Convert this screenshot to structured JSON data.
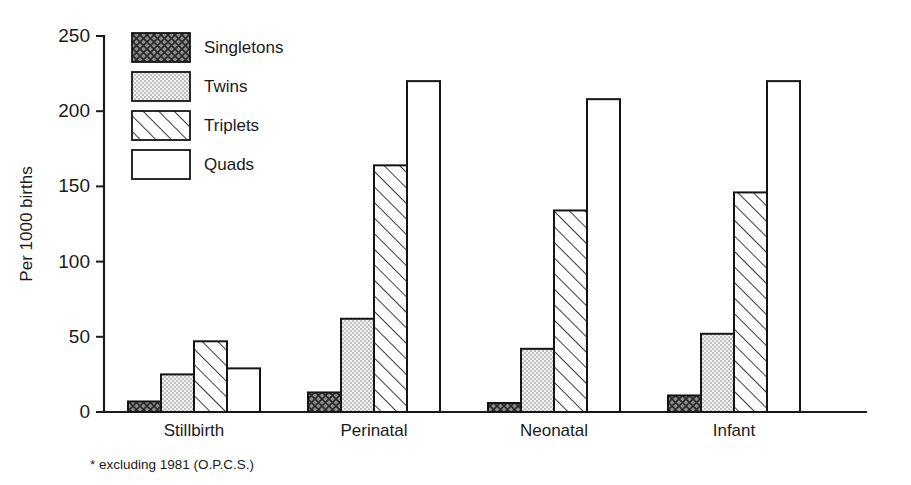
{
  "chart_data": {
    "type": "bar",
    "title": "",
    "subtitle": "",
    "xlabel": "",
    "ylabel": "Per 1000 births",
    "categories": [
      "Stillbirth",
      "Perinatal",
      "Neonatal",
      "Infant"
    ],
    "series": [
      {
        "name": "Singletons",
        "pattern": "cross-hatch-dark",
        "values": [
          7,
          13,
          6,
          11
        ]
      },
      {
        "name": "Twins",
        "pattern": "fine-stipple-light",
        "values": [
          25,
          62,
          42,
          52
        ]
      },
      {
        "name": "Triplets",
        "pattern": "diagonal-hatch",
        "values": [
          47,
          164,
          134,
          146
        ]
      },
      {
        "name": "Quads",
        "pattern": "solid-white",
        "values": [
          29,
          220,
          208,
          220
        ]
      }
    ],
    "ylim": [
      0,
      250
    ],
    "yticks": [
      0,
      50,
      100,
      150,
      200,
      250
    ],
    "ytick_labels": [
      "0",
      "50",
      "100",
      "150",
      "200",
      "250"
    ],
    "grid": false,
    "legend_position": "top-left-inside",
    "legend_entries": [
      "Singletons",
      "Twins",
      "Triplets",
      "Quads"
    ],
    "annotations": [
      "* excluding 1981 (O.P.C.S.)"
    ]
  },
  "footnote": "* excluding 1981 (O.P.C.S.)",
  "colors": {
    "background": "#ffffff",
    "ink": "#1a1a1a",
    "axis": "#1c1c1c",
    "singletons_fill": "#6f6f6f",
    "twins_fill": "#dcdcdc",
    "triplets_fill": "#ffffff",
    "quads_fill": "#ffffff"
  }
}
